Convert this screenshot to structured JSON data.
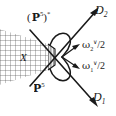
{
  "figure": {
    "kind": "mathematical-diagram",
    "width": 116,
    "height": 116,
    "background_color": "#ffffff",
    "ink_color": "#1a1a1a"
  },
  "labels": {
    "dual_projective_space": {
      "symbol": "P",
      "exponent": "5",
      "open_paren": "(",
      "close_paren": ")",
      "star": "*",
      "full_text": "(P5)*"
    },
    "projective_space": {
      "symbol": "P",
      "exponent": "5",
      "full_text": "P5"
    },
    "variety": {
      "text": "X"
    },
    "line_d2": {
      "base": "D",
      "subscript": "2",
      "full_text": "D2"
    },
    "line_d1": {
      "base": "D",
      "subscript": "1",
      "full_text": "D1"
    },
    "omega_2": {
      "base": "ω",
      "subscript": "2",
      "superscript": "∨",
      "divisor": "/2",
      "full_text": "ω2∨/2"
    },
    "omega_1": {
      "base": "ω",
      "subscript": "1",
      "superscript": "∨",
      "divisor": "/2",
      "full_text": "ω1∨/2"
    }
  },
  "geometry": {
    "vertex": {
      "x": 62,
      "y": 57
    },
    "hatched_cone": {
      "name": "crosshatched-cone-region",
      "grid_spacing": 5,
      "grid_color": "#555555"
    },
    "rays": [
      {
        "name": "d2-ray",
        "label": "D2",
        "arrow": true
      },
      {
        "name": "d1-ray",
        "label": "D1",
        "arrow": true
      },
      {
        "name": "omega2-ray",
        "label": "ω2∨/2",
        "arrow": true
      },
      {
        "name": "omega1-ray",
        "label": "ω1∨/2",
        "arrow": true
      }
    ],
    "lens": {
      "name": "lens-curve-region"
    }
  }
}
